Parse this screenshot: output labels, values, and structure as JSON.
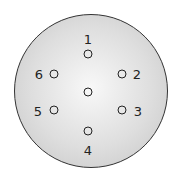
{
  "diagram": {
    "type": "connector-pinout",
    "pins": [
      {
        "label": "1",
        "x": 88,
        "y": 54,
        "lx": 88,
        "ly": 39
      },
      {
        "label": "2",
        "x": 122,
        "y": 74,
        "lx": 137,
        "ly": 74
      },
      {
        "label": "3",
        "x": 122,
        "y": 110,
        "lx": 138,
        "ly": 111
      },
      {
        "label": "4",
        "x": 88,
        "y": 131,
        "lx": 88,
        "ly": 150
      },
      {
        "label": "5",
        "x": 54,
        "y": 110,
        "lx": 38,
        "ly": 111
      },
      {
        "label": "6",
        "x": 54,
        "y": 74,
        "lx": 39,
        "ly": 74
      },
      {
        "label": "",
        "x": 88,
        "y": 92
      }
    ]
  }
}
